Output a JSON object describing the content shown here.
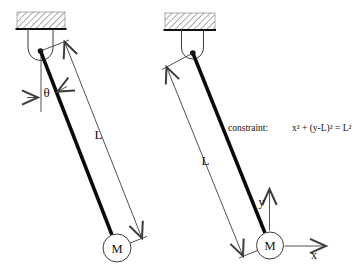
{
  "diagram": {
    "colors": {
      "background": "#ffffff",
      "ink": "#111111",
      "thin_line": "#3d3d3d",
      "hatch": "#555555"
    },
    "left_pendulum": {
      "angle_label": "θ",
      "length_label": "L",
      "mass_label": "M"
    },
    "right_pendulum": {
      "length_label": "L",
      "mass_label": "M",
      "x_axis_label": "x",
      "y_axis_label": "y",
      "constraint_prefix": "constraint:",
      "constraint_formula": "x² + (y-L)² = L²"
    }
  }
}
